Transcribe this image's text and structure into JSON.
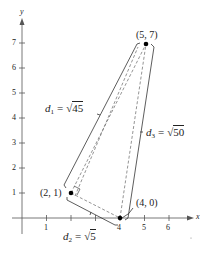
{
  "axes": {
    "x_label": "x",
    "y_label": "y",
    "x_ticks": [
      "1",
      "2",
      "3",
      "4",
      "5",
      "6"
    ],
    "y_ticks": [
      "1",
      "2",
      "3",
      "4",
      "5",
      "6",
      "7"
    ]
  },
  "points": [
    {
      "label": "(2, 1)",
      "x": 2,
      "y": 1
    },
    {
      "label": "(4, 0)",
      "x": 4,
      "y": 0
    },
    {
      "label": "(5, 7)",
      "x": 5,
      "y": 7
    }
  ],
  "distances": {
    "d1": {
      "name": "d",
      "sub": "1",
      "eq": "=",
      "radicand": "45"
    },
    "d2": {
      "name": "d",
      "sub": "2",
      "eq": "=",
      "radicand": "5"
    },
    "d3": {
      "name": "d",
      "sub": "3",
      "eq": "=",
      "radicand": "50"
    }
  },
  "colors": {
    "line": "#333333",
    "dashed": "#555555",
    "point": "#000000"
  }
}
